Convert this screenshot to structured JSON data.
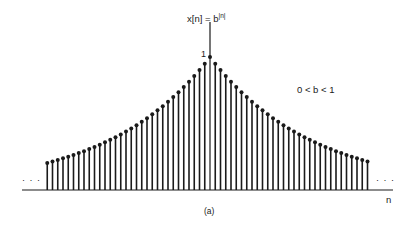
{
  "figure": {
    "equation_label": "x[n] = b",
    "equation_exponent": "|n|",
    "peak_label": "1",
    "condition_label": "0 < b < 1",
    "axis_label": "n",
    "ellipsis_left": "· · ·",
    "ellipsis_right": "· · ·",
    "caption": "(a)"
  },
  "chart_data": {
    "type": "stem",
    "annotation": "0 < b < 1",
    "xlabel": "n",
    "ylabel": "",
    "caption": "(a)",
    "b": 0.95,
    "n_min": -31,
    "n_max": 30,
    "peak_value": 1,
    "ylim": [
      0,
      1
    ],
    "grid": false,
    "continues_both_directions": true
  },
  "colors": {
    "ink": "#1a1a1a",
    "background": "#ffffff"
  }
}
